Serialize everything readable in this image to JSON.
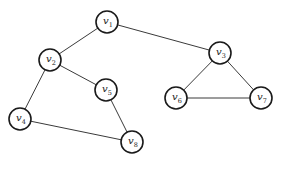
{
  "diagram": {
    "type": "undirected-graph",
    "stroke_color": "#1a1a1a",
    "background": "#ffffff",
    "node_radius": 11,
    "nodes": [
      {
        "id": "v1",
        "base": "v",
        "sub": "1",
        "x": 107,
        "y": 22
      },
      {
        "id": "v2",
        "base": "v",
        "sub": "2",
        "x": 50,
        "y": 60
      },
      {
        "id": "v3",
        "base": "v",
        "sub": "3",
        "x": 220,
        "y": 53
      },
      {
        "id": "v4",
        "base": "v",
        "sub": "4",
        "x": 20,
        "y": 119
      },
      {
        "id": "v5",
        "base": "v",
        "sub": "5",
        "x": 106,
        "y": 90
      },
      {
        "id": "v6",
        "base": "v",
        "sub": "6",
        "x": 176,
        "y": 98
      },
      {
        "id": "v7",
        "base": "v",
        "sub": "7",
        "x": 261,
        "y": 98
      },
      {
        "id": "v8",
        "base": "v",
        "sub": "8",
        "x": 132,
        "y": 142
      }
    ],
    "edges": [
      [
        "v1",
        "v2"
      ],
      [
        "v1",
        "v3"
      ],
      [
        "v2",
        "v5"
      ],
      [
        "v2",
        "v4"
      ],
      [
        "v5",
        "v8"
      ],
      [
        "v4",
        "v8"
      ],
      [
        "v3",
        "v6"
      ],
      [
        "v3",
        "v7"
      ],
      [
        "v6",
        "v7"
      ]
    ]
  }
}
